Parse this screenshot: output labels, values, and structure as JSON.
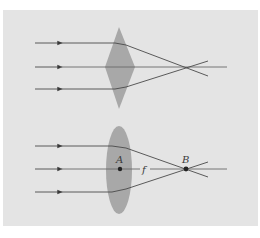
{
  "figure": {
    "background_color": "#ffffff",
    "panel_color": "#e4e4e4",
    "lens_color": "#a8a8a8",
    "ray_color": "#4a4a4a",
    "top_diagram": {
      "lens_shape": "diamond",
      "ray_count": 3,
      "description": "Parallel rays through diamond-shaped lens converge at a point"
    },
    "bottom_diagram": {
      "lens_shape": "biconvex-ellipse",
      "ray_count": 3,
      "labels": {
        "center": "A",
        "focal_length": "f",
        "focal_point": "B"
      },
      "description": "Parallel rays through convex lens converge at focal point B; f is distance from A to B"
    }
  }
}
